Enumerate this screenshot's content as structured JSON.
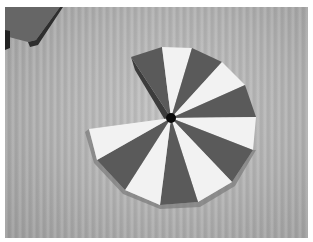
{
  "image": {
    "description": "Black-and-white photo of a segmented wooden disc with alternating dark and light wedges radiating from a dark central hub, with one wedge section missing, lying on a wood-grain surface; a dark wooden board corner is visible at top-left.",
    "subject": "segmented wooden disc",
    "colors": {
      "background_surface": "#b4b4b4",
      "dark_wedge": "#5a5a5a",
      "light_wedge": "#f2f2f2",
      "hub": "#0a0a0a",
      "board": "#666666",
      "border": "#ffffff"
    },
    "wedges": [
      {
        "tone": "dark",
        "points": "131,57 162,47 171,118"
      },
      {
        "tone": "light",
        "points": "162,47 192,48 171,118"
      },
      {
        "tone": "dark",
        "points": "192,48 222,62 171,118"
      },
      {
        "tone": "light",
        "points": "222,62 245,85 171,118"
      },
      {
        "tone": "dark",
        "points": "245,85 256,117 171,118"
      },
      {
        "tone": "light",
        "points": "256,117 253,150 171,118"
      },
      {
        "tone": "dark",
        "points": "253,150 232,182 171,118"
      },
      {
        "tone": "light",
        "points": "232,182 198,202 171,118"
      },
      {
        "tone": "dark",
        "points": "198,202 160,205 171,118"
      },
      {
        "tone": "light",
        "points": "160,205 125,190 171,118"
      },
      {
        "tone": "dark",
        "points": "125,190 97,160 171,118"
      },
      {
        "tone": "light",
        "points": "97,160 89,129 171,118"
      }
    ]
  }
}
